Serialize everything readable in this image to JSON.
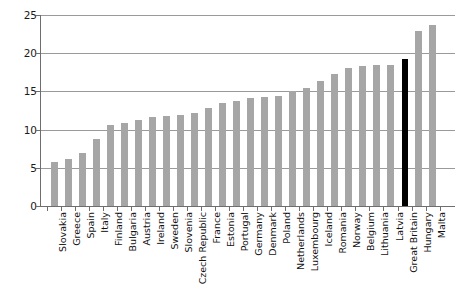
{
  "chart_data": {
    "type": "bar",
    "title": "",
    "subtitle": "",
    "xlabel": "",
    "ylabel": "",
    "ylim": [
      0,
      25
    ],
    "yticks": [
      0,
      5,
      10,
      15,
      20,
      25
    ],
    "ytick_labels": [
      "0",
      "5",
      "10",
      "15",
      "20",
      "25"
    ],
    "grid": true,
    "legend": "none",
    "orientation": "vertical",
    "bar_color": "#a6a6a6",
    "highlight_color": "#000000",
    "highlight_category": "Great Britain",
    "categories": [
      "Slovakia",
      "Greece",
      "Spain",
      "Italy",
      "Finland",
      "Bulgaria",
      "Austria",
      "Ireland",
      "Sweden",
      "Slovenia",
      "Czech Republic",
      "France",
      "Estonia",
      "Portugal",
      "Germany",
      "Denmark",
      "Poland",
      "Netherlands",
      "Luxembourg",
      "Iceland",
      "Romania",
      "Norway",
      "Belgium",
      "Lithuania",
      "Latvia",
      "Great Britain",
      "Hungary",
      "Malta"
    ],
    "values": [
      5.7,
      6.1,
      7.0,
      8.8,
      10.6,
      10.9,
      11.3,
      11.7,
      11.8,
      11.9,
      12.2,
      12.8,
      13.5,
      13.8,
      14.2,
      14.3,
      14.4,
      15.0,
      15.5,
      16.3,
      17.3,
      18.0,
      18.3,
      18.4,
      18.5,
      19.2,
      22.9,
      23.7
    ]
  }
}
